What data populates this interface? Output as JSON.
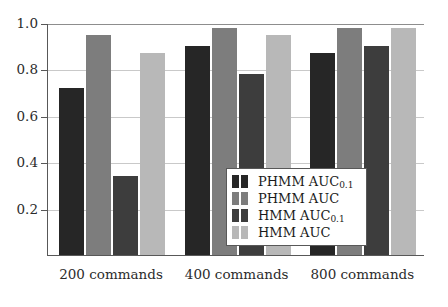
{
  "chart_data": {
    "type": "bar",
    "title": "",
    "xlabel": "",
    "ylabel": "",
    "categories": [
      "200 commands",
      "400 commands",
      "800 commands"
    ],
    "series": [
      {
        "name": "PHMM AUC0.1",
        "label": "PHMM AUC",
        "sublabel": "0.1",
        "color": "#262626",
        "values": [
          0.72,
          0.9,
          0.87
        ]
      },
      {
        "name": "PHMM AUC",
        "label": "PHMM AUC",
        "sublabel": "",
        "color": "#7d7d7d",
        "values": [
          0.95,
          0.98,
          0.98
        ]
      },
      {
        "name": "HMM AUC0.1",
        "label": "HMM AUC",
        "sublabel": "0.1",
        "color": "#3d3d3d",
        "values": [
          0.34,
          0.78,
          0.9
        ]
      },
      {
        "name": "HMM AUC",
        "label": "HMM AUC",
        "sublabel": "",
        "color": "#b8b8b8",
        "values": [
          0.87,
          0.95,
          0.98
        ]
      }
    ],
    "ylim": [
      0.0,
      1.0
    ],
    "yticks": [
      0.2,
      0.4,
      0.6,
      0.8,
      1.0
    ],
    "ytick_labels": [
      "0.2",
      "0.4",
      "0.6",
      "0.8",
      "1.0"
    ],
    "grid": true,
    "legend_position": "lower right"
  },
  "legend": {
    "entries": [
      {
        "label": "PHMM AUC",
        "sub": "0.1"
      },
      {
        "label": "PHMM AUC",
        "sub": ""
      },
      {
        "label": "HMM AUC",
        "sub": "0.1"
      },
      {
        "label": "HMM AUC",
        "sub": ""
      }
    ]
  },
  "colors": {
    "series_1": "#262626",
    "series_2": "#7d7d7d",
    "series_3": "#3d3d3d",
    "series_4": "#b8b8b8",
    "axis": "#585858",
    "grid": "#c9c9c9",
    "background": "#ffffff"
  }
}
